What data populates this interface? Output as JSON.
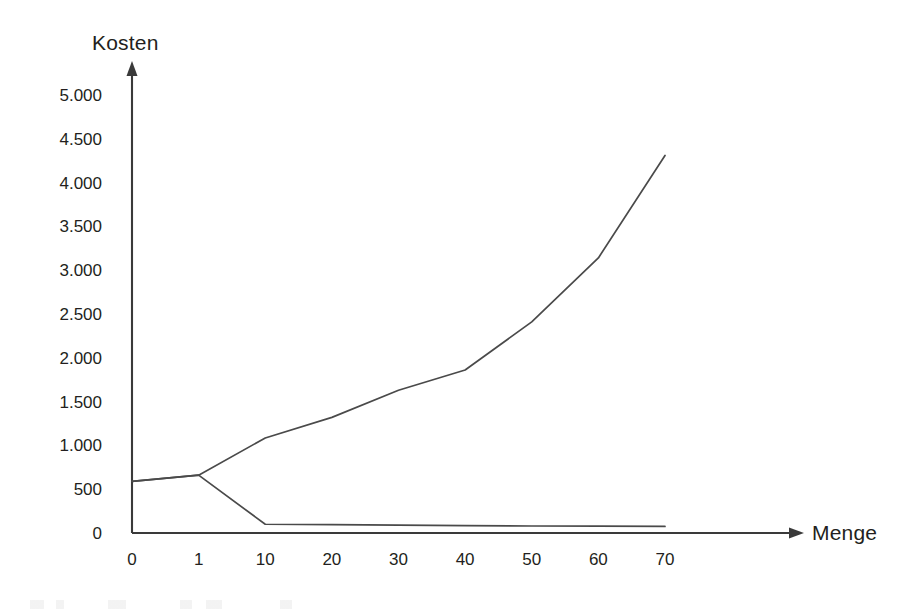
{
  "chart_data": {
    "type": "line",
    "title": "",
    "xlabel": "Menge",
    "ylabel": "Kosten",
    "categories": [
      "0",
      "1",
      "10",
      "20",
      "30",
      "40",
      "50",
      "60",
      "70"
    ],
    "x_tick_labels": [
      "0",
      "1",
      "10",
      "20",
      "30",
      "40",
      "50",
      "60",
      "70"
    ],
    "y_tick_labels": [
      "0",
      "500",
      "1.000",
      "1.500",
      "2.000",
      "2.500",
      "3.000",
      "3.500",
      "4.000",
      "4.500",
      "5.000"
    ],
    "y_tick_values": [
      0,
      500,
      1000,
      1500,
      2000,
      2500,
      3000,
      3500,
      4000,
      4500,
      5000
    ],
    "ylim": [
      0,
      5000
    ],
    "grid": false,
    "legend": false,
    "axis_style": "arrow-headed L-shaped axes",
    "number_format": "german-thousands-dot",
    "series": [
      {
        "name": "gesamtkosten",
        "color": "#4a4a4a",
        "values": [
          590,
          660,
          1085,
          1320,
          1630,
          1860,
          2410,
          3140,
          4310
        ]
      },
      {
        "name": "stueckkosten",
        "color": "#4a4a4a",
        "values": [
          590,
          660,
          100,
          95,
          90,
          85,
          80,
          78,
          75
        ]
      }
    ],
    "annotations": []
  },
  "colors": {
    "line": "#4a4a4a",
    "axis": "#3a3a3a",
    "text": "#231f20",
    "background": "#ffffff"
  }
}
